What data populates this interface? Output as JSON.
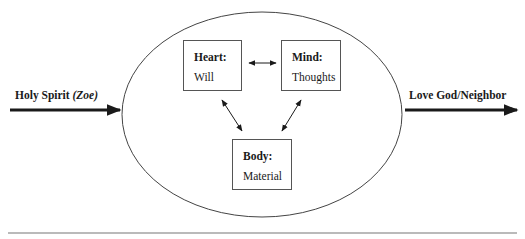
{
  "diagram": {
    "input": {
      "label": "Holy Spirit",
      "label_italic": "(Zoe)"
    },
    "output": {
      "label": "Love God/Neighbor"
    },
    "nodes": [
      {
        "id": "heart",
        "title": "Heart:",
        "subtitle": "Will"
      },
      {
        "id": "mind",
        "title": "Mind:",
        "subtitle": "Thoughts"
      },
      {
        "id": "body",
        "title": "Body:",
        "subtitle": "Material"
      }
    ],
    "edges": [
      {
        "from": "heart",
        "to": "mind",
        "type": "bidirectional"
      },
      {
        "from": "heart",
        "to": "body",
        "type": "bidirectional"
      },
      {
        "from": "mind",
        "to": "body",
        "type": "bidirectional"
      },
      {
        "from": "input",
        "to": "ellipse",
        "type": "directed"
      },
      {
        "from": "ellipse",
        "to": "output",
        "type": "directed"
      }
    ],
    "colors": {
      "line": "#1a1a1a",
      "box_border": "#555555",
      "background": "#ffffff"
    }
  }
}
